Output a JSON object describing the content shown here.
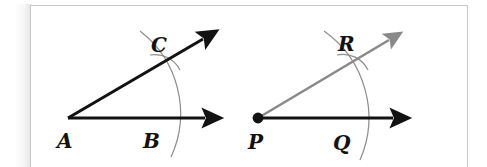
{
  "figure": {
    "kind": "geometry-construction-diagram",
    "background_color": "#ffffff",
    "frame_border_color": "#c9c9c9",
    "ink_color": "#121212",
    "arc_color": "#8f8f8f",
    "copy_ray_color": "#8a8a8a"
  },
  "left_figure": {
    "name": "original-angle",
    "vertex_label": "A",
    "base_ray_label": "B",
    "slant_ray_label": "C",
    "vertex_dot": false,
    "vertex": {
      "x": 68,
      "y": 118
    },
    "base_ray_end": {
      "x": 214,
      "y": 118
    },
    "slant_ray_end": {
      "x": 212,
      "y": 33
    },
    "arc": {
      "start_x": 140,
      "start_y": 31,
      "end_x": 171,
      "end_y": 157,
      "radius": 104
    },
    "tick_arc": {
      "start_x": 150,
      "start_y": 55,
      "end_x": 180,
      "end_y": 70
    },
    "labels": {
      "vertex": {
        "text": "A",
        "x": 57,
        "y": 148
      },
      "base": {
        "text": "B",
        "x": 143,
        "y": 148
      },
      "slant": {
        "text": "C",
        "x": 151,
        "y": 52
      }
    }
  },
  "right_figure": {
    "name": "copied-angle",
    "vertex_label": "P",
    "base_ray_label": "Q",
    "slant_ray_label": "R",
    "vertex_dot": true,
    "vertex": {
      "x": 258,
      "y": 118
    },
    "base_ray_end": {
      "x": 402,
      "y": 118
    },
    "slant_ray_end": {
      "x": 398,
      "y": 33
    },
    "arc": {
      "start_x": 324,
      "start_y": 31,
      "end_x": 360,
      "end_y": 160,
      "radius": 106
    },
    "tick_arc": {
      "start_x": 337,
      "start_y": 55,
      "end_x": 368,
      "end_y": 70
    },
    "labels": {
      "vertex": {
        "text": "P",
        "x": 248,
        "y": 149
      },
      "base": {
        "text": "Q",
        "x": 333,
        "y": 150
      },
      "slant": {
        "text": "R",
        "x": 338,
        "y": 51
      }
    }
  },
  "labels_all": [
    "A",
    "B",
    "C",
    "P",
    "Q",
    "R"
  ]
}
